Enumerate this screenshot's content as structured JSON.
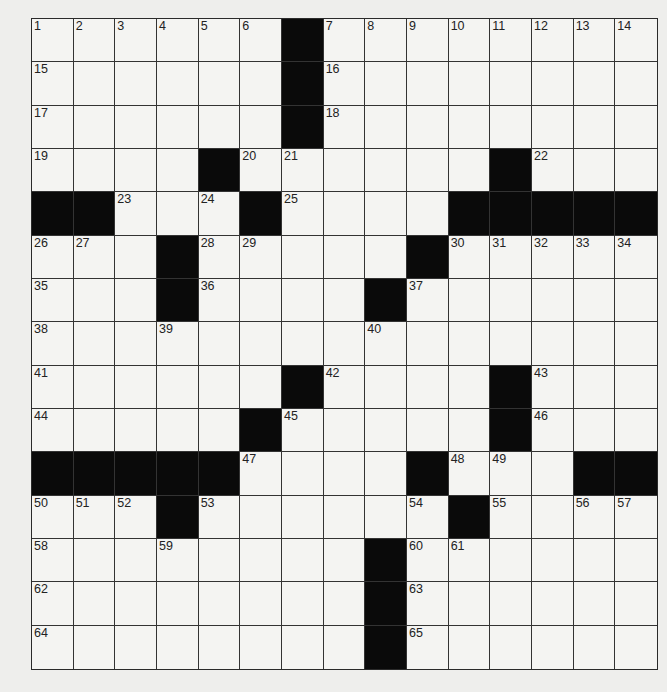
{
  "puzzle": {
    "rows": 15,
    "cols": 15,
    "colors": {
      "background": "#eeeeec",
      "cell_white": "#f4f4f2",
      "cell_black": "#0a0a0a",
      "grid_line": "#333333",
      "number_text": "#222222"
    },
    "grid": [
      [
        "1",
        "2",
        "3",
        "4",
        "5",
        "6",
        "#",
        "7",
        "8",
        "9",
        "10",
        "11",
        "12",
        "13",
        "14"
      ],
      [
        "15",
        "",
        "",
        "",
        "",
        "",
        "#",
        "16",
        "",
        "",
        "",
        "",
        "",
        "",
        ""
      ],
      [
        "17",
        "",
        "",
        "",
        "",
        "",
        "#",
        "18",
        "",
        "",
        "",
        "",
        "",
        "",
        ""
      ],
      [
        "19",
        "",
        "",
        "",
        "#",
        "20",
        "21",
        "",
        "",
        "",
        "",
        "#",
        "22",
        "",
        ""
      ],
      [
        "#",
        "#",
        "23",
        "",
        "24",
        "#",
        "25",
        "",
        "",
        "",
        "#",
        "#",
        "#",
        "#",
        "#"
      ],
      [
        "26",
        "27",
        "",
        "#",
        "28",
        "29",
        "",
        "",
        "",
        "#",
        "30",
        "31",
        "32",
        "33",
        "34"
      ],
      [
        "35",
        "",
        "",
        "#",
        "36",
        "",
        "",
        "",
        "#",
        "37",
        "",
        "",
        "",
        "",
        ""
      ],
      [
        "38",
        "",
        "",
        "39",
        "",
        "",
        "",
        "",
        "40",
        "",
        "",
        "",
        "",
        "",
        ""
      ],
      [
        "41",
        "",
        "",
        "",
        "",
        "",
        "#",
        "42",
        "",
        "",
        "",
        "#",
        "43",
        "",
        ""
      ],
      [
        "44",
        "",
        "",
        "",
        "",
        "#",
        "45",
        "",
        "",
        "",
        "",
        "#",
        "46",
        "",
        ""
      ],
      [
        "#",
        "#",
        "#",
        "#",
        "#",
        "47",
        "",
        "",
        "",
        "#",
        "48",
        "49",
        "",
        "#",
        "#"
      ],
      [
        "50",
        "51",
        "52",
        "#",
        "53",
        "",
        "",
        "",
        "",
        "54",
        "#",
        "55",
        "",
        "56",
        "57"
      ],
      [
        "58",
        "",
        "",
        "59",
        "",
        "",
        "",
        "",
        "#",
        "60",
        "61",
        "",
        "",
        "",
        ""
      ],
      [
        "62",
        "",
        "",
        "",
        "",
        "",
        "",
        "",
        "#",
        "63",
        "",
        "",
        "",
        "",
        ""
      ],
      [
        "64",
        "",
        "",
        "",
        "",
        "",
        "",
        "",
        "#",
        "65",
        "",
        "",
        "",
        "",
        ""
      ]
    ]
  }
}
